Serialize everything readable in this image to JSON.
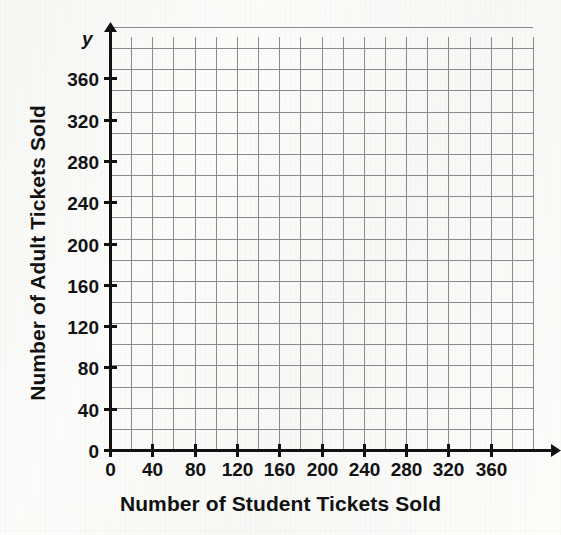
{
  "figure": {
    "kind": "coordinate-grid",
    "background_color": "#fbfbfa",
    "grid_line_color": "#8a8a8a",
    "axis_color": "#111111",
    "text_color": "#111111"
  },
  "axes": {
    "x": {
      "title": "Number of Student Tickets Sold",
      "variable_label": "x",
      "tick_labels": [
        "0",
        "40",
        "80",
        "120",
        "160",
        "200",
        "240",
        "280",
        "320",
        "360"
      ],
      "tick_values": [
        0,
        40,
        80,
        120,
        160,
        200,
        240,
        280,
        320,
        360
      ],
      "min": 0,
      "max": 400,
      "major_step": 40,
      "minor_step": 20,
      "has_arrow": true
    },
    "y": {
      "title": "Number of Adult Tickets Sold",
      "variable_label": "y",
      "tick_labels": [
        "0",
        "40",
        "80",
        "120",
        "160",
        "200",
        "240",
        "280",
        "320",
        "360"
      ],
      "tick_values": [
        0,
        40,
        80,
        120,
        160,
        200,
        240,
        280,
        320,
        360
      ],
      "min": 0,
      "max": 400,
      "major_step": 40,
      "minor_step": 20,
      "has_arrow": true
    }
  },
  "chart_data": {
    "type": "scatter",
    "title": "",
    "subtitle": "",
    "xlabel": "Number of Student Tickets Sold",
    "ylabel": "Number of Adult Tickets Sold",
    "xlim": [
      0,
      400
    ],
    "ylim": [
      0,
      400
    ],
    "x_ticks": [
      0,
      40,
      80,
      120,
      160,
      200,
      240,
      280,
      320,
      360
    ],
    "y_ticks": [
      0,
      40,
      80,
      120,
      160,
      200,
      240,
      280,
      320,
      360
    ],
    "x_tick_labels": [
      "0",
      "40",
      "80",
      "120",
      "160",
      "200",
      "240",
      "280",
      "320",
      "360"
    ],
    "y_tick_labels": [
      "0",
      "40",
      "80",
      "120",
      "160",
      "200",
      "240",
      "280",
      "320",
      "360"
    ],
    "grid": true,
    "grid_minor_step": 20,
    "grid_columns": 20,
    "grid_rows": 20,
    "legend": null,
    "legend_position": "none",
    "series": [],
    "annotations": [],
    "note": "Empty blank coordinate grid — no data plotted; provided for a student to graph on."
  },
  "geometry": {
    "origin_x": 110,
    "origin_y": 450,
    "grid_right": 533,
    "grid_top": 37,
    "cell_px": 21.15
  }
}
